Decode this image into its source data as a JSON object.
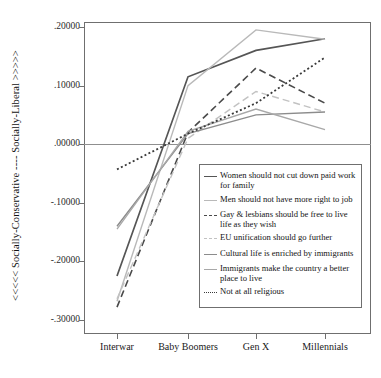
{
  "chart_data": {
    "type": "line",
    "title": "",
    "xlabel": "",
    "ylabel": "<<<<< Socially-Conservative ---- Socially-Liberal >>>>>",
    "categories": [
      "Interwar",
      "Baby Boomers",
      "Gen X",
      "Millennials"
    ],
    "ylim": [
      -0.33,
      0.23
    ],
    "yticks": [
      ".20000",
      ".10000",
      ".00000",
      "-.10000",
      "-.20000",
      "-.30000"
    ],
    "ytick_values": [
      0.2,
      0.1,
      0.0,
      -0.1,
      -0.2,
      -0.3
    ],
    "grid": false,
    "zero_line": true,
    "legend_position": "inside-bottom-right",
    "series": [
      {
        "name": "Women should not cut down paid work for family",
        "style": "solid",
        "color": "#555555",
        "width": 1.7,
        "values": [
          -0.225,
          0.115,
          0.16,
          0.18
        ]
      },
      {
        "name": "Men should not have more right to job",
        "style": "solid",
        "color": "#b9b9b9",
        "width": 1.4,
        "values": [
          -0.268,
          0.1,
          0.195,
          0.179
        ]
      },
      {
        "name": "Gay & lesbians should be free to live life as they wish",
        "style": "dashed",
        "color": "#4a4a4a",
        "width": 1.6,
        "values": [
          -0.278,
          0.02,
          0.13,
          0.07
        ]
      },
      {
        "name": "EU unification should go further",
        "style": "dashed",
        "color": "#c2c2c2",
        "width": 1.4,
        "values": [
          -0.264,
          0.01,
          0.09,
          0.055
        ]
      },
      {
        "name": "Cultural life is enriched by immigrants",
        "style": "solid",
        "color": "#8c8c8c",
        "width": 1.4,
        "values": [
          -0.14,
          0.018,
          0.05,
          0.055
        ]
      },
      {
        "name": "Immigrants make the country a better place to live",
        "style": "solid",
        "color": "#a8a8a8",
        "width": 1.3,
        "values": [
          -0.145,
          0.022,
          0.06,
          0.025
        ]
      },
      {
        "name": "Not at all religious",
        "style": "dotted",
        "color": "#3a3a3a",
        "width": 1.8,
        "values": [
          -0.043,
          0.018,
          0.07,
          0.148
        ]
      }
    ]
  },
  "axis": {
    "y_title": "<<<<< Socially-Conservative ---- Socially-Liberal >>>>>",
    "y_ticks": [
      ".20000",
      ".10000",
      ".00000",
      "-.10000",
      "-.20000",
      "-.30000"
    ],
    "x_ticks": [
      "Interwar",
      "Baby Boomers",
      "Gen X",
      "Millennials"
    ]
  },
  "legend": {
    "items": [
      {
        "label": "Women should not cut down paid work for family",
        "style": "solid",
        "color": "#555555"
      },
      {
        "label": "Men should not have more right to job",
        "style": "solid",
        "color": "#b9b9b9"
      },
      {
        "label": "Gay & lesbians should be free to live life as they wish",
        "style": "dashed",
        "color": "#4a4a4a"
      },
      {
        "label": "EU unification should go further",
        "style": "dashed",
        "color": "#c2c2c2"
      },
      {
        "label": "Cultural life is enriched by immigrants",
        "style": "solid",
        "color": "#8c8c8c"
      },
      {
        "label": "Immigrants make the country a better place to live",
        "style": "solid",
        "color": "#a8a8a8"
      },
      {
        "label": "Not at all religious",
        "style": "dotted",
        "color": "#3a3a3a"
      }
    ]
  }
}
